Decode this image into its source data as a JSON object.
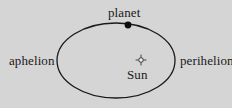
{
  "figure": {
    "name": "planetary-orbit-diagram",
    "background_color": "#d5d5d5",
    "stroke_color": "#1a1a1a",
    "text_color": "#1a1a1a"
  },
  "labels": {
    "aphelion": "aphelion",
    "perihelion": "perihelion",
    "planet": "planet",
    "sun": "Sun"
  },
  "markers": {
    "planet_marker": "filled-dot",
    "sun_marker": "sun-glyph"
  },
  "geometry": {
    "ellipse_center_x": 116,
    "ellipse_center_y": 60.5,
    "ellipse_radius_x": 59,
    "ellipse_radius_y": 37.5,
    "planet_dot_x": 128,
    "planet_dot_y": 25,
    "planet_dot_radius": 3.4,
    "sun_x": 141,
    "sun_y": 60,
    "sun_radius": 2.2
  }
}
